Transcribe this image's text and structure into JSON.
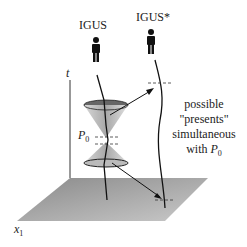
{
  "diagram": {
    "observers": [
      {
        "label": "IGUS"
      },
      {
        "label": "IGUS*"
      }
    ],
    "axes": {
      "t": "t",
      "x1": "x",
      "x1_sub": "1"
    },
    "point": {
      "label": "P",
      "sub": "0"
    },
    "annotation": {
      "line1": "possible",
      "line2": "\"presents\"",
      "line3": "simultaneous",
      "line4": "with",
      "line4_var": "P",
      "line4_sub": "0"
    },
    "colors": {
      "plane": "#9a9a9a",
      "cone": "#b5b5b5",
      "line": "#111111"
    }
  }
}
